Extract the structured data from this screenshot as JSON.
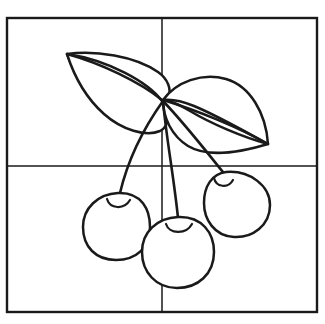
{
  "document": {
    "kind": "line-art-illustration",
    "subject": "Three cherries with two leaves",
    "style": "coloring-page outline",
    "caption_fragment": ""
  },
  "canvas": {
    "width": 325,
    "height": 324,
    "background_color": "#ffffff",
    "ink_color": "#1a1a1a"
  },
  "frame": {
    "label": "outer-frame",
    "x": 7,
    "y": 18,
    "width": 310,
    "height": 294,
    "stroke_width": 2.2,
    "stroke_color": "#1a1a1a"
  },
  "grid": {
    "label": "quadrant-divider-cross",
    "stroke_width": 1.5,
    "stroke_color": "#1a1a1a",
    "vertical_x": 162,
    "horizontal_y": 166,
    "cells": 4
  },
  "artwork": {
    "junction": {
      "x": 163,
      "y": 101
    },
    "leaves": [
      {
        "name": "left-leaf",
        "tip": {
          "x": 67,
          "y": 54
        },
        "base": {
          "x": 163,
          "y": 101
        },
        "has_center_vein": true
      },
      {
        "name": "right-leaf",
        "tip": {
          "x": 268,
          "y": 144
        },
        "base": {
          "x": 163,
          "y": 101
        },
        "has_center_vein": true
      }
    ],
    "stems": [
      {
        "name": "left-stem",
        "from": {
          "x": 163,
          "y": 101
        },
        "to": {
          "x": 119,
          "y": 193
        }
      },
      {
        "name": "middle-stem",
        "from": {
          "x": 163,
          "y": 101
        },
        "to": {
          "x": 178,
          "y": 218
        }
      },
      {
        "name": "right-stem",
        "from": {
          "x": 163,
          "y": 101
        },
        "to": {
          "x": 226,
          "y": 176
        }
      }
    ],
    "cherries": [
      {
        "name": "left-cherry",
        "cx": 116,
        "cy": 226,
        "rx": 33,
        "ry": 33,
        "dimple": {
          "x": 120,
          "y": 194
        }
      },
      {
        "name": "middle-cherry",
        "cx": 178,
        "cy": 251,
        "rx": 36,
        "ry": 36,
        "dimple": {
          "x": 178,
          "y": 218
        }
      },
      {
        "name": "right-cherry",
        "cx": 237,
        "cy": 204,
        "rx": 33,
        "ry": 33,
        "dimple": {
          "x": 226,
          "y": 176
        }
      }
    ]
  }
}
